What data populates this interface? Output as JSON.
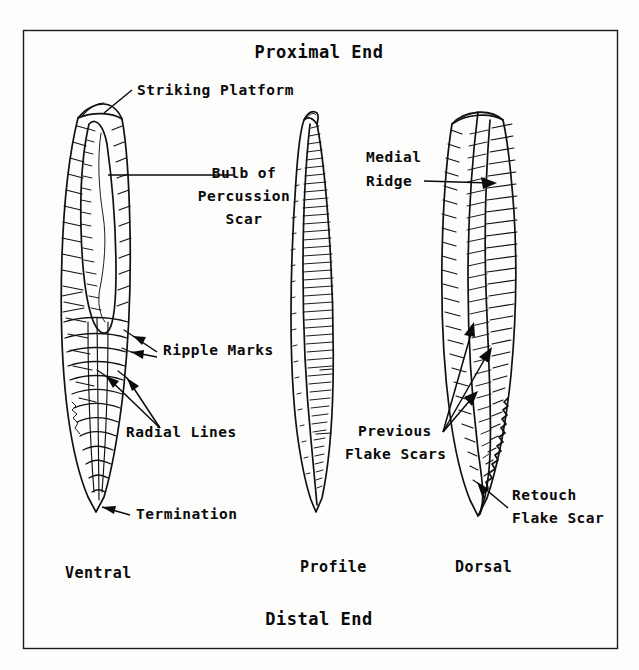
{
  "figure": {
    "kind": "lithic-flake-anatomy-diagram",
    "frame_color": "#1a1a1a",
    "ink_color": "#111111",
    "background_color": "#fdfdfc"
  },
  "titles": {
    "top": "Proximal End",
    "bottom": "Distal End"
  },
  "views": [
    {
      "key": "ventral",
      "label": "Ventral",
      "x": 65,
      "y": 578
    },
    {
      "key": "profile",
      "label": "Profile",
      "x": 300,
      "y": 572
    },
    {
      "key": "dorsal",
      "label": "Dorsal",
      "x": 455,
      "y": 572
    }
  ],
  "callouts": [
    {
      "key": "striking-platform",
      "lines": [
        "Striking Platform"
      ],
      "align": "start",
      "x": 137,
      "y": 95,
      "leader": "line-from-text-down-left-to-platform",
      "target": "ventral top edge"
    },
    {
      "key": "bulb-of-percussion-scar",
      "lines": [
        "Bulb of",
        "Percussion",
        "Scar"
      ],
      "align": "middle",
      "x": 244,
      "y": 178,
      "leader": "horizontal-line-left-into-bulb",
      "target": "ventral bulb scar"
    },
    {
      "key": "ripple-marks",
      "lines": [
        "Ripple Marks"
      ],
      "align": "start",
      "x": 163,
      "y": 355,
      "leader": "two-arrows-pointing-left",
      "target": "ventral ripple lines"
    },
    {
      "key": "radial-lines",
      "lines": [
        "Radial Lines"
      ],
      "align": "start",
      "x": 126,
      "y": 437,
      "leader": "two-arrows-fanning-up-left",
      "target": "ventral radial lines"
    },
    {
      "key": "termination",
      "lines": [
        "Termination"
      ],
      "align": "start",
      "x": 136,
      "y": 519,
      "leader": "arrow-pointing-up-left",
      "target": "ventral distal tip"
    },
    {
      "key": "medial-ridge",
      "lines": [
        "Medial",
        "Ridge"
      ],
      "align": "start",
      "x": 366,
      "y": 162,
      "leader": "arrow-pointing-right",
      "target": "dorsal central ridge"
    },
    {
      "key": "previous-flake-scars",
      "lines": [
        "Previous",
        "Flake Scars"
      ],
      "align": "start",
      "x": 358,
      "y": 436,
      "leader": "three-arrows-fanning-up-right",
      "target": "dorsal flake scar facets"
    },
    {
      "key": "retouch-flake-scar",
      "lines": [
        "Retouch",
        "Flake Scar"
      ],
      "align": "start",
      "x": 512,
      "y": 500,
      "leader": "arrow-pointing-up-left",
      "target": "dorsal serrated distal edge"
    }
  ]
}
